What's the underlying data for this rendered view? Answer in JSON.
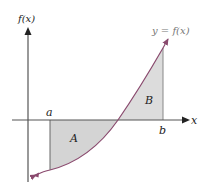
{
  "diagram": {
    "y_axis_label": "f(x)",
    "x_axis_label": "x",
    "curve_label": "y = f(x)",
    "point_a_label": "a",
    "point_b_label": "b",
    "region_a_label": "A",
    "region_b_label": "B",
    "colors": {
      "axis": "#555555",
      "curve": "#8a4a6e",
      "fill": "#d4d4d4",
      "text": "#222222",
      "curve_label": "#777777"
    }
  }
}
